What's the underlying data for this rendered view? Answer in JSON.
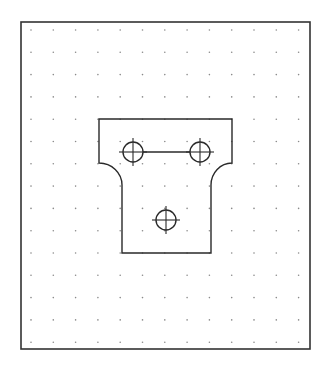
{
  "drawing": {
    "type": "cad-part-sketch",
    "colors": {
      "background": "#ffffff",
      "frame": "#333333",
      "outline": "#2a2a2a",
      "grid_dot": "#8a8a8a"
    },
    "frame": {
      "x": 21,
      "y": 22,
      "width": 289,
      "height": 327
    },
    "grid": {
      "columns": 13,
      "rows": 15,
      "origin_x": 31,
      "origin_y": 30,
      "spacing_x": 22.3,
      "spacing_y": 22.3
    },
    "part_outline": {
      "top_left": [
        99,
        119
      ],
      "top_right": [
        232,
        119
      ],
      "left_shoulder_y": 163,
      "right_shoulder_y": 163,
      "neck_left_x": 122,
      "neck_right_x": 211,
      "neck_top_y": 185,
      "bottom_y": 253
    },
    "holes": [
      {
        "name": "hole-left",
        "cx": 133,
        "cy": 152,
        "r": 10,
        "cross": 14
      },
      {
        "name": "hole-right",
        "cx": 200,
        "cy": 152,
        "r": 10,
        "cross": 14
      },
      {
        "name": "hole-bottom",
        "cx": 166,
        "cy": 220,
        "r": 10,
        "cross": 14
      }
    ],
    "connector_line": {
      "x1": 143,
      "y1": 152,
      "x2": 190,
      "y2": 152
    }
  }
}
